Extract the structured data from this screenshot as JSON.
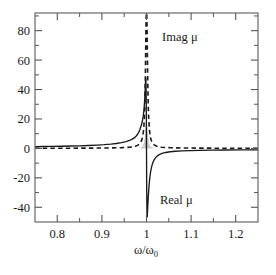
{
  "chart_data": {
    "type": "line",
    "title": "",
    "subtitle": "",
    "xlabel": "ω/ω₀",
    "ylabel": "",
    "xlim": [
      0.75,
      1.25
    ],
    "ylim": [
      -50,
      92
    ],
    "grid": false,
    "legend_position": "inline-annotations",
    "x_ticks": [
      "0.8",
      "0.9",
      "1",
      "1.1",
      "1.2"
    ],
    "x_tick_values": [
      0.8,
      0.9,
      1.0,
      1.1,
      1.2
    ],
    "x_minor_ticks": [
      0.75,
      0.85,
      0.95,
      1.05,
      1.15,
      1.25
    ],
    "y_ticks": [
      "80",
      "60",
      "40",
      "20",
      "0",
      "-20",
      "-40"
    ],
    "y_tick_values": [
      80,
      60,
      40,
      20,
      0,
      -20,
      -40
    ],
    "y_minor_ticks": [
      -50,
      -30,
      -10,
      10,
      30,
      50,
      70,
      90
    ],
    "annotations": [
      {
        "text": "Imag  μ",
        "x": 1.035,
        "y": 73
      },
      {
        "text": "Real  μ",
        "x": 1.03,
        "y": -38
      }
    ],
    "series": [
      {
        "name": "Real μ",
        "style": "solid",
        "color": "#1a1a1a",
        "x": [
          0.75,
          0.77,
          0.79,
          0.81,
          0.83,
          0.85,
          0.87,
          0.89,
          0.905,
          0.92,
          0.932,
          0.944,
          0.954,
          0.962,
          0.968,
          0.973,
          0.977,
          0.98,
          0.983,
          0.985,
          0.987,
          0.9885,
          0.99,
          0.9912,
          0.9922,
          0.993,
          0.9937,
          0.9943,
          0.9948,
          0.9952,
          0.9956,
          0.9959,
          0.9962,
          0.9965,
          0.9968,
          0.9971,
          0.9974,
          0.9977,
          0.998,
          0.9984,
          0.9988,
          0.9992,
          0.9996,
          1.0,
          1.0004,
          1.0008,
          1.0012,
          1.0016,
          1.002,
          1.0024,
          1.0028,
          1.0032,
          1.0036,
          1.004,
          1.0045,
          1.005,
          1.0056,
          1.0063,
          1.0071,
          1.008,
          1.0091,
          1.0104,
          1.012,
          1.014,
          1.0165,
          1.0195,
          1.0235,
          1.0285,
          1.035,
          1.043,
          1.053,
          1.065,
          1.08,
          1.098,
          1.12,
          1.145,
          1.175,
          1.21,
          1.25
        ],
        "y": [
          1.2,
          1.28,
          1.37,
          1.48,
          1.61,
          1.77,
          1.97,
          2.25,
          2.52,
          2.92,
          3.35,
          3.95,
          4.65,
          5.45,
          6.3,
          7.3,
          8.45,
          9.6,
          11.2,
          12.7,
          14.6,
          15.9,
          17.7,
          19.3,
          21.1,
          22.8,
          24.6,
          26.4,
          28.1,
          29.7,
          31.5,
          32.9,
          34.5,
          36.2,
          38.0,
          39.9,
          41.9,
          44.0,
          46.2,
          48.0,
          45.0,
          38.0,
          25.0,
          0.0,
          -25.0,
          -38.0,
          -45.0,
          -46.5,
          -44.5,
          -42.0,
          -39.5,
          -37.2,
          -35.0,
          -33.0,
          -30.6,
          -28.4,
          -26.0,
          -23.4,
          -20.9,
          -18.6,
          -16.2,
          -14.0,
          -11.9,
          -9.9,
          -8.1,
          -6.6,
          -5.3,
          -4.2,
          -3.35,
          -2.75,
          -2.3,
          -1.95,
          -1.68,
          -1.48,
          -1.32,
          -1.2,
          -1.1,
          -1.02,
          -0.96
        ]
      },
      {
        "name": "Imag μ",
        "style": "dashed",
        "color": "#1a1a1a",
        "x": [
          0.75,
          0.79,
          0.83,
          0.87,
          0.9,
          0.925,
          0.945,
          0.958,
          0.968,
          0.975,
          0.98,
          0.984,
          0.987,
          0.9895,
          0.9915,
          0.993,
          0.9942,
          0.9952,
          0.996,
          0.9967,
          0.9973,
          0.9978,
          0.9983,
          0.9987,
          0.9991,
          0.9994,
          0.9997,
          1.0,
          1.0003,
          1.0006,
          1.0009,
          1.0013,
          1.0017,
          1.0022,
          1.0028,
          1.0035,
          1.0043,
          1.0052,
          1.0063,
          1.0076,
          1.0092,
          1.0112,
          1.0138,
          1.0172,
          1.0215,
          1.027,
          1.034,
          1.043,
          1.055,
          1.07,
          1.09,
          1.115,
          1.145,
          1.18,
          1.215,
          1.25
        ],
        "y": [
          0.1,
          0.12,
          0.15,
          0.2,
          0.26,
          0.36,
          0.52,
          0.72,
          1.0,
          1.45,
          2.05,
          2.9,
          4.1,
          5.8,
          8.1,
          11.3,
          15.5,
          21.0,
          27.5,
          36.0,
          47.0,
          58.0,
          70.0,
          80.0,
          87.0,
          90.5,
          92.0,
          92.0,
          92.0,
          90.5,
          87.0,
          80.0,
          70.0,
          58.0,
          46.0,
          35.0,
          26.0,
          19.0,
          13.8,
          10.0,
          7.1,
          5.0,
          3.5,
          2.4,
          1.65,
          1.15,
          0.82,
          0.6,
          0.44,
          0.33,
          0.25,
          0.2,
          0.16,
          0.13,
          0.11,
          0.1
        ]
      },
      {
        "name": "Shaded resonance region",
        "style": "filled",
        "color": "#cccccc",
        "x": [
          0.9855,
          0.9875,
          0.9895,
          0.9912,
          0.9928,
          0.994,
          0.9951,
          0.996,
          0.9968,
          0.9975,
          0.9982,
          0.9988,
          0.9994,
          1.0,
          1.0006,
          1.0012,
          1.0018,
          1.0025,
          1.0032,
          1.004,
          1.0049,
          1.006,
          1.0072,
          1.0088,
          1.0108,
          1.0132,
          1.016
        ],
        "y": [
          0.3,
          0.55,
          0.95,
          1.55,
          2.5,
          3.6,
          5.2,
          7.1,
          9.6,
          12.4,
          15.0,
          16.8,
          17.8,
          18.0,
          17.8,
          16.8,
          15.0,
          12.4,
          9.6,
          7.1,
          5.2,
          3.6,
          2.5,
          1.55,
          0.95,
          0.55,
          0.3
        ]
      }
    ]
  },
  "figure": {
    "axis_color": "#555555",
    "frame_color": "#555555",
    "background": "#ffffff",
    "xlabel_main": "ω/ω",
    "xlabel_sub": "0",
    "imag_label": "Imag  μ",
    "real_label": "Real  μ"
  }
}
